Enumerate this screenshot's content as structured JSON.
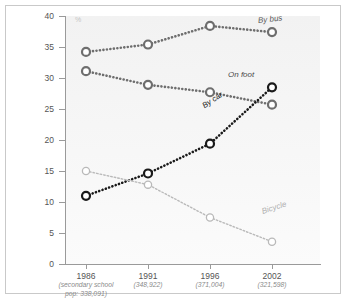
{
  "chart_data": {
    "type": "line",
    "title": "",
    "xlabel": "",
    "ylabel": "%",
    "ylim": [
      0,
      40
    ],
    "yticks": [
      0,
      5,
      10,
      15,
      20,
      25,
      30,
      35,
      40
    ],
    "grid": false,
    "legend_position": "inline-right",
    "categories": [
      "1986",
      "1991",
      "1996",
      "2002"
    ],
    "category_sublabels": [
      "(secondary school\npop: 338,091)",
      "(348,922)",
      "(371,004)",
      "(321,598)"
    ],
    "series": [
      {
        "name": "By bus",
        "values": [
          34.2,
          35.4,
          38.4,
          37.4
        ],
        "color": "#6e6e6e",
        "style": "dotted-thick"
      },
      {
        "name": "On foot",
        "values": [
          31.1,
          28.9,
          27.7,
          25.7
        ],
        "color": "#6e6e6e",
        "style": "dotted-thick"
      },
      {
        "name": "By car",
        "values": [
          11.0,
          14.6,
          19.4,
          28.5
        ],
        "color": "#1a1a1a",
        "style": "dotted-thick"
      },
      {
        "name": "Bicycle",
        "values": [
          15.0,
          12.8,
          7.5,
          3.6
        ],
        "color": "#b9b9b9",
        "style": "dotted-thin"
      }
    ]
  },
  "axis": {
    "y_unit_symbol": "%",
    "tick_labels": [
      "0",
      "5",
      "10",
      "15",
      "20",
      "25",
      "30",
      "35",
      "40"
    ]
  },
  "labels": {
    "by_bus": "By bus",
    "on_foot": "On foot",
    "by_car": "By car",
    "bicycle": "Bicycle"
  },
  "colors": {
    "dark": "#1a1a1a",
    "mid": "#6e6e6e",
    "light": "#b9b9b9",
    "axis": "#9a9a9a",
    "panel": "#f4f4f4",
    "frame": "#c9c9c9"
  }
}
